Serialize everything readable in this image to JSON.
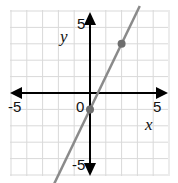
{
  "chart_data": {
    "type": "line",
    "title": "",
    "xlabel": "x",
    "ylabel": "y",
    "xlim": [
      -5,
      5
    ],
    "ylim": [
      -5,
      5
    ],
    "grid": true,
    "tick_labels": {
      "x_min": "-5",
      "x_max": "5",
      "y_min": "-5",
      "y_max": "5",
      "origin": "0"
    },
    "series": [
      {
        "name": "line",
        "equation": "y = 2x - 1",
        "x": [
          -2,
          3
        ],
        "y": [
          -5,
          5
        ]
      }
    ],
    "points": [
      {
        "x": 0,
        "y": -1
      },
      {
        "x": 2,
        "y": 3
      }
    ],
    "colors": {
      "line": "#8a8a8a",
      "point": "#6e6e6e",
      "grid": "#d9d9d9",
      "axis": "#000000"
    }
  }
}
